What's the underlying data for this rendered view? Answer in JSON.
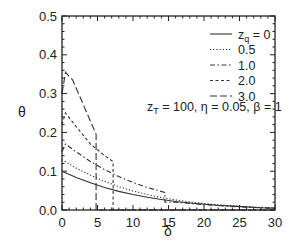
{
  "chart_data": {
    "type": "line",
    "title": "",
    "xlabel": "δ",
    "ylabel": "θ",
    "xlim": [
      0,
      30
    ],
    "ylim": [
      0,
      0.5
    ],
    "xticks": [
      0,
      5,
      10,
      15,
      20,
      25,
      30
    ],
    "xtick_labels": [
      "0",
      "5",
      "10",
      "15",
      "20",
      "25",
      "30"
    ],
    "yticks": [
      0.0,
      0.1,
      0.2,
      0.3,
      0.4,
      0.5
    ],
    "ytick_labels": [
      "0.0",
      "0.1",
      "0.2",
      "0.3",
      "0.4",
      "0.5"
    ],
    "grid": false,
    "legend_position": "upper right",
    "annotation": "zT = 100, η = 0.05, β = 1",
    "series": [
      {
        "name": "zq = 0",
        "style": "solid",
        "x": [
          0,
          2,
          4,
          6,
          8,
          10,
          12,
          14,
          16,
          18,
          20,
          22,
          24,
          26,
          28,
          30
        ],
        "y": [
          0.1,
          0.084,
          0.07,
          0.058,
          0.048,
          0.04,
          0.033,
          0.027,
          0.022,
          0.018,
          0.015,
          0.012,
          0.01,
          0.008,
          0.006,
          0.005
        ]
      },
      {
        "name": "0.5",
        "style": "dotted",
        "x": [
          0,
          2,
          4,
          6,
          8,
          10,
          12,
          14,
          16,
          18,
          20,
          22,
          24,
          26,
          28,
          30
        ],
        "y": [
          0.13,
          0.108,
          0.09,
          0.074,
          0.06,
          0.049,
          0.04,
          0.032,
          0.026,
          0.021,
          0.017,
          0.013,
          0.011,
          0.008,
          0.007,
          0.005
        ]
      },
      {
        "name": "1.0",
        "style": "dash-dot",
        "x": [
          0,
          0.5,
          2,
          4,
          6,
          8,
          10,
          12,
          14.5,
          14.5,
          16,
          18,
          20,
          22,
          24,
          26,
          28,
          30
        ],
        "y": [
          0.15,
          0.17,
          0.15,
          0.125,
          0.104,
          0.086,
          0.071,
          0.058,
          0.045,
          0.02,
          0.02,
          0.017,
          0.014,
          0.011,
          0.009,
          0.007,
          0.006,
          0.005
        ]
      },
      {
        "name": "2.0",
        "style": "dashed",
        "x": [
          0,
          0.5,
          2,
          4,
          6,
          7.2,
          7.2,
          10,
          14,
          18,
          22,
          26,
          30
        ],
        "y": [
          0.22,
          0.25,
          0.215,
          0.17,
          0.14,
          0.125,
          0.0,
          0.0,
          0.0,
          0.0,
          0.0,
          0.0,
          0.0
        ]
      },
      {
        "name": "3.0",
        "style": "long-dash",
        "x": [
          0,
          0.5,
          1.5,
          4.8,
          4.8,
          10,
          20,
          30
        ],
        "y": [
          0.3,
          0.355,
          0.335,
          0.195,
          0.0,
          0.0,
          0.0,
          0.0
        ]
      }
    ]
  },
  "labels": {
    "xlabel": "δ",
    "ylabel": "θ",
    "annotation": "zT = 100, η = 0.05, β = 1",
    "legend": [
      "zq = 0",
      "0.5",
      "1.0",
      "2.0",
      "3.0"
    ]
  }
}
